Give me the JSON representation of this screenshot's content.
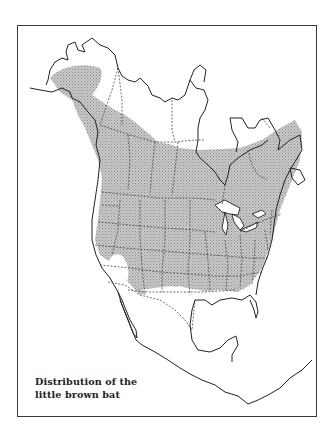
{
  "map": {
    "title": "Distribution of the little brown bat",
    "caption_line1": "Distribution of the",
    "caption_line2": "little brown bat",
    "region": "North America",
    "legend": {
      "range_fill": "stippled gray",
      "range_color": "#b8b8b8",
      "outline_color": "#222222",
      "border_color": "#555555"
    }
  }
}
